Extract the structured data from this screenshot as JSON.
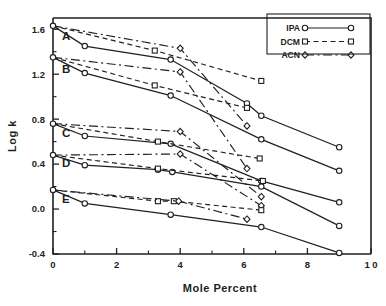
{
  "chart_data": {
    "type": "line",
    "title": "",
    "xlabel": "Mole  Percent",
    "ylabel": "Log k",
    "xlim": [
      0,
      10
    ],
    "ylim": [
      -0.4,
      1.7
    ],
    "xticks": [
      0,
      2,
      4,
      6,
      8,
      10
    ],
    "xtick_labels": [
      "0",
      "2",
      "4",
      "6",
      "8",
      "1 0"
    ],
    "yticks": [
      -0.4,
      0.0,
      0.4,
      0.8,
      1.2,
      1.6
    ],
    "ytick_labels": [
      "-0.4",
      "0.0",
      "0.4",
      "0.8",
      "1.2",
      "1.6"
    ],
    "x_minor_step": 1,
    "y_minor_step": 0.2,
    "grid": false,
    "legend_position": "top-right",
    "legend": [
      {
        "name": "IPA",
        "marker": "circle",
        "dash": "solid"
      },
      {
        "name": "DCM",
        "marker": "square",
        "dash": "dashed"
      },
      {
        "name": "ACN",
        "marker": "diamond",
        "dash": "dashdot"
      }
    ],
    "group_labels": [
      {
        "text": "A",
        "x": 0.28,
        "y": 1.5
      },
      {
        "text": "B",
        "x": 0.28,
        "y": 1.21
      },
      {
        "text": "C",
        "x": 0.28,
        "y": 0.64
      },
      {
        "text": "D",
        "x": 0.28,
        "y": 0.37
      },
      {
        "text": "E",
        "x": 0.28,
        "y": 0.05
      }
    ],
    "groups": [
      {
        "label": "A",
        "series": [
          {
            "name": "IPA",
            "marker": "circle",
            "dash": "solid",
            "points": [
              [
                0,
                1.63
              ],
              [
                1.0,
                1.45
              ],
              [
                3.7,
                1.33
              ],
              [
                6.1,
                0.94
              ],
              [
                6.55,
                0.83
              ],
              [
                9.0,
                0.55
              ]
            ]
          },
          {
            "name": "DCM",
            "marker": "square",
            "dash": "dashed",
            "points": [
              [
                0,
                1.63
              ],
              [
                3.2,
                1.41
              ],
              [
                6.55,
                1.14
              ]
            ]
          },
          {
            "name": "ACN",
            "marker": "diamond",
            "dash": "dashdot",
            "points": [
              [
                0,
                1.63
              ],
              [
                4.0,
                1.43
              ],
              [
                6.1,
                0.74
              ]
            ]
          }
        ]
      },
      {
        "label": "B",
        "series": [
          {
            "name": "IPA",
            "marker": "circle",
            "dash": "solid",
            "points": [
              [
                0,
                1.35
              ],
              [
                1.0,
                1.21
              ],
              [
                3.7,
                1.01
              ],
              [
                6.55,
                0.62
              ],
              [
                9.0,
                0.34
              ]
            ]
          },
          {
            "name": "DCM",
            "marker": "square",
            "dash": "dashed",
            "points": [
              [
                0,
                1.35
              ],
              [
                3.2,
                1.1
              ],
              [
                6.1,
                0.9
              ]
            ]
          },
          {
            "name": "ACN",
            "marker": "diamond",
            "dash": "dashdot",
            "points": [
              [
                0,
                1.35
              ],
              [
                4.0,
                1.22
              ],
              [
                6.1,
                0.36
              ]
            ]
          }
        ]
      },
      {
        "label": "C",
        "series": [
          {
            "name": "IPA",
            "marker": "circle",
            "dash": "solid",
            "points": [
              [
                0,
                0.76
              ],
              [
                1.0,
                0.65
              ],
              [
                3.7,
                0.58
              ],
              [
                6.55,
                0.25
              ],
              [
                9.0,
                0.06
              ]
            ]
          },
          {
            "name": "DCM",
            "marker": "square",
            "dash": "dashed",
            "points": [
              [
                0,
                0.76
              ],
              [
                3.3,
                0.6
              ],
              [
                6.5,
                0.45
              ]
            ]
          },
          {
            "name": "ACN",
            "marker": "diamond",
            "dash": "dashdot",
            "points": [
              [
                0,
                0.76
              ],
              [
                4.0,
                0.69
              ],
              [
                6.55,
                0.11
              ]
            ]
          }
        ]
      },
      {
        "label": "D",
        "series": [
          {
            "name": "IPA",
            "marker": "circle",
            "dash": "solid",
            "points": [
              [
                0,
                0.48
              ],
              [
                1.0,
                0.39
              ],
              [
                3.3,
                0.35
              ],
              [
                3.75,
                0.33
              ],
              [
                6.55,
                0.2
              ],
              [
                9.0,
                -0.15
              ]
            ]
          },
          {
            "name": "DCM",
            "marker": "square",
            "dash": "dashed",
            "points": [
              [
                0,
                0.48
              ],
              [
                3.3,
                0.36
              ],
              [
                6.6,
                0.25
              ]
            ]
          },
          {
            "name": "ACN",
            "marker": "diamond",
            "dash": "dashdot",
            "points": [
              [
                0,
                0.48
              ],
              [
                4.0,
                0.49
              ],
              [
                6.55,
                0.03
              ]
            ]
          }
        ]
      },
      {
        "label": "E",
        "series": [
          {
            "name": "IPA",
            "marker": "circle",
            "dash": "solid",
            "points": [
              [
                0,
                0.17
              ],
              [
                1.0,
                0.05
              ],
              [
                3.7,
                -0.05
              ],
              [
                6.55,
                -0.16
              ],
              [
                9.0,
                -0.39
              ]
            ]
          },
          {
            "name": "DCM",
            "marker": "square",
            "dash": "dashed",
            "points": [
              [
                0,
                0.17
              ],
              [
                3.3,
                0.07
              ],
              [
                3.8,
                0.07
              ],
              [
                6.55,
                -0.01
              ]
            ]
          },
          {
            "name": "ACN",
            "marker": "diamond",
            "dash": "dashdot",
            "points": [
              [
                0,
                0.17
              ],
              [
                3.95,
                0.07
              ],
              [
                6.1,
                -0.09
              ]
            ]
          }
        ]
      }
    ]
  }
}
